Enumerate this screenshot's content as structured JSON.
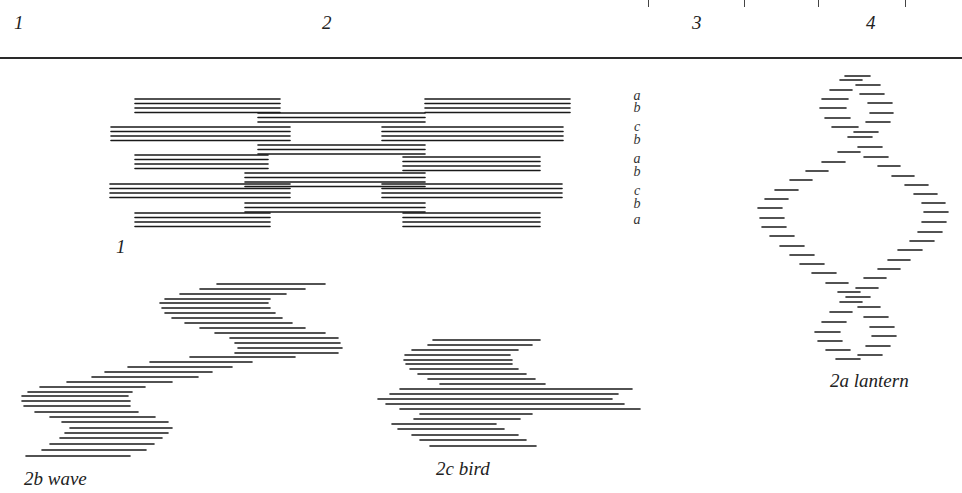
{
  "header": {
    "column_numbers": [
      "1",
      "2",
      "3",
      "4"
    ]
  },
  "figures": {
    "fig1": {
      "label": "1",
      "row_labels": [
        "a",
        "b",
        "c",
        "b",
        "a",
        "b",
        "c",
        "b",
        "a"
      ]
    },
    "fig2a": {
      "label": "2a lantern"
    },
    "fig2b": {
      "label": "2b wave"
    },
    "fig2c": {
      "label": "2c bird"
    }
  }
}
